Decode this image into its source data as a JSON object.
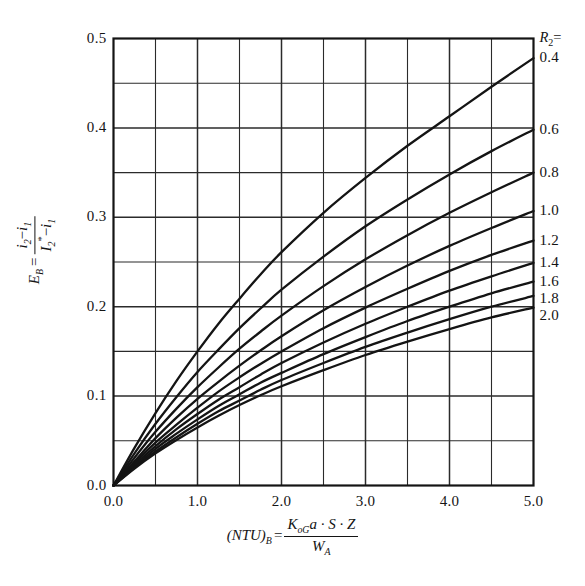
{
  "chart_data": {
    "type": "line",
    "title": "",
    "subtitle": "",
    "xlabel": "(NTU)_B = K_oG·a·S·Z / W_A",
    "ylabel": "E_B = (i2 - i1) / (I2* - i1)",
    "xlim": [
      0.0,
      5.0
    ],
    "ylim": [
      0.0,
      0.5
    ],
    "xticks": [
      "0.0",
      "1.0",
      "2.0",
      "3.0",
      "4.0",
      "5.0"
    ],
    "xtick_values": [
      0.0,
      1.0,
      2.0,
      3.0,
      4.0,
      5.0
    ],
    "yticks": [
      "0.0",
      "0.1",
      "0.2",
      "0.3",
      "0.4",
      "0.5"
    ],
    "ytick_values": [
      0.0,
      0.1,
      0.2,
      0.3,
      0.4,
      0.5
    ],
    "grid": true,
    "grid_x_step": 0.5,
    "grid_y_step": 0.05,
    "legend_position": "right-edge-curve-labels",
    "legend_title": "R2 =",
    "series": [
      {
        "name": "0.4",
        "x": [
          0.0,
          0.25,
          0.5,
          0.75,
          1.0,
          1.25,
          1.5,
          1.75,
          2.0,
          2.5,
          3.0,
          3.5,
          4.0,
          4.5,
          5.0
        ],
        "values": [
          0.0,
          0.042,
          0.081,
          0.117,
          0.15,
          0.181,
          0.209,
          0.236,
          0.261,
          0.305,
          0.344,
          0.38,
          0.413,
          0.446,
          0.478
        ]
      },
      {
        "name": "0.6",
        "x": [
          0.0,
          0.25,
          0.5,
          0.75,
          1.0,
          1.25,
          1.5,
          1.75,
          2.0,
          2.5,
          3.0,
          3.5,
          4.0,
          4.5,
          5.0
        ],
        "values": [
          0.0,
          0.036,
          0.069,
          0.099,
          0.127,
          0.152,
          0.176,
          0.198,
          0.219,
          0.256,
          0.29,
          0.32,
          0.348,
          0.374,
          0.398
        ]
      },
      {
        "name": "0.8",
        "x": [
          0.0,
          0.25,
          0.5,
          0.75,
          1.0,
          1.25,
          1.5,
          1.75,
          2.0,
          2.5,
          3.0,
          3.5,
          4.0,
          4.5,
          5.0
        ],
        "values": [
          0.0,
          0.031,
          0.06,
          0.086,
          0.11,
          0.132,
          0.153,
          0.172,
          0.19,
          0.223,
          0.253,
          0.28,
          0.305,
          0.328,
          0.35
        ]
      },
      {
        "name": "1.0",
        "x": [
          0.0,
          0.25,
          0.5,
          0.75,
          1.0,
          1.25,
          1.5,
          1.75,
          2.0,
          2.5,
          3.0,
          3.5,
          4.0,
          4.5,
          5.0
        ],
        "values": [
          0.0,
          0.027,
          0.053,
          0.076,
          0.097,
          0.116,
          0.134,
          0.151,
          0.167,
          0.196,
          0.222,
          0.246,
          0.268,
          0.288,
          0.307
        ]
      },
      {
        "name": "1.2",
        "x": [
          0.0,
          0.25,
          0.5,
          0.75,
          1.0,
          1.25,
          1.5,
          1.75,
          2.0,
          2.5,
          3.0,
          3.5,
          4.0,
          4.5,
          5.0
        ],
        "values": [
          0.0,
          0.025,
          0.048,
          0.068,
          0.087,
          0.105,
          0.121,
          0.136,
          0.15,
          0.176,
          0.199,
          0.22,
          0.24,
          0.258,
          0.274
        ]
      },
      {
        "name": "1.4",
        "x": [
          0.0,
          0.25,
          0.5,
          0.75,
          1.0,
          1.25,
          1.5,
          1.75,
          2.0,
          2.5,
          3.0,
          3.5,
          4.0,
          4.5,
          5.0
        ],
        "values": [
          0.0,
          0.023,
          0.044,
          0.063,
          0.08,
          0.096,
          0.11,
          0.124,
          0.137,
          0.16,
          0.181,
          0.2,
          0.218,
          0.234,
          0.249
        ]
      },
      {
        "name": "1.6",
        "x": [
          0.0,
          0.25,
          0.5,
          0.75,
          1.0,
          1.25,
          1.5,
          1.75,
          2.0,
          2.5,
          3.0,
          3.5,
          4.0,
          4.5,
          5.0
        ],
        "values": [
          0.0,
          0.021,
          0.041,
          0.058,
          0.074,
          0.089,
          0.102,
          0.115,
          0.126,
          0.147,
          0.166,
          0.184,
          0.2,
          0.215,
          0.228
        ]
      },
      {
        "name": "1.8",
        "x": [
          0.0,
          0.25,
          0.5,
          0.75,
          1.0,
          1.25,
          1.5,
          1.75,
          2.0,
          2.5,
          3.0,
          3.5,
          4.0,
          4.5,
          5.0
        ],
        "values": [
          0.0,
          0.02,
          0.038,
          0.054,
          0.069,
          0.083,
          0.095,
          0.107,
          0.118,
          0.137,
          0.155,
          0.171,
          0.186,
          0.2,
          0.212
        ]
      },
      {
        "name": "2.0",
        "x": [
          0.0,
          0.25,
          0.5,
          0.75,
          1.0,
          1.25,
          1.5,
          1.75,
          2.0,
          2.5,
          3.0,
          3.5,
          4.0,
          4.5,
          5.0
        ],
        "values": [
          0.0,
          0.019,
          0.036,
          0.051,
          0.065,
          0.078,
          0.09,
          0.101,
          0.111,
          0.129,
          0.146,
          0.161,
          0.175,
          0.188,
          0.199
        ]
      }
    ],
    "annotations": []
  },
  "axes": {
    "legend_header": {
      "symbol": "R",
      "symbol_sub": "2",
      "equals": "="
    },
    "xaxis": {
      "expr_lhs": "(NTU)",
      "expr_lhs_sub": "B",
      "equals": "=",
      "numerator": "K",
      "numerator_sub": "oG",
      "numerator_rest": "a · S · Z",
      "denominator": "W",
      "denominator_sub": "A"
    },
    "yaxis": {
      "symbol": "E",
      "symbol_sub": "B",
      "equals": "=",
      "num_a": "i",
      "num_a_sub": "2",
      "minus": "−",
      "num_b": "i",
      "num_b_sub": "1",
      "den_a": "I",
      "den_a_sub": "2",
      "den_a_star": "*",
      "den_b": "i",
      "den_b_sub": "1"
    }
  },
  "style": {
    "background": "#ffffff",
    "axis_color": "#141414",
    "grid_color": "#2b2b2b",
    "curve_color": "#141414"
  }
}
